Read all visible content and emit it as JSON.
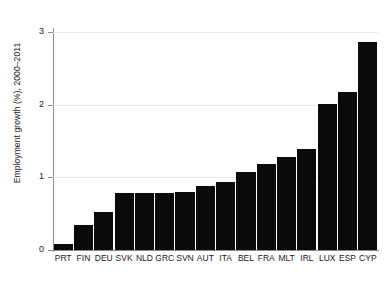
{
  "chart_data": {
    "type": "bar",
    "title": "",
    "subtitle": "",
    "xlabel": "",
    "ylabel": "Employment growth (%), 2000–2011",
    "categories": [
      "PRT",
      "FIN",
      "DEU",
      "SVK",
      "NLD",
      "GRC",
      "SVN",
      "AUT",
      "ITA",
      "BEL",
      "FRA",
      "MLT",
      "IRL",
      "LUX",
      "ESP",
      "CYP"
    ],
    "values": [
      0.08,
      0.35,
      0.53,
      0.78,
      0.78,
      0.79,
      0.8,
      0.88,
      0.93,
      1.08,
      1.19,
      1.28,
      1.39,
      2.01,
      2.18,
      2.86
    ],
    "ylim": [
      0,
      3.05
    ],
    "y_ticks": [
      0,
      1,
      2,
      3
    ],
    "y_tick_labels": [
      "0",
      "1",
      "2",
      "3"
    ],
    "grid": "horizontal",
    "legend": null,
    "bar_color": "#0a0a0a",
    "grid_color": "#e9e9e9",
    "axis_color": "#8c8c8c",
    "background": "#ffffff"
  }
}
